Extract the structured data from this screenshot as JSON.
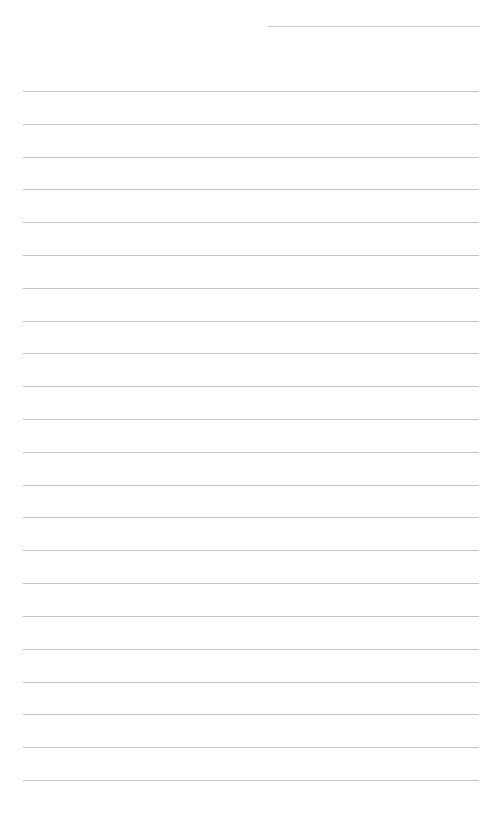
{
  "page": {
    "type": "lined-paper",
    "background": "#ffffff",
    "line_color": "#c4c4c4",
    "header_line": {
      "x": 268,
      "y": 26,
      "width": 212
    },
    "rules": {
      "count": 22,
      "x": 23,
      "width": 456,
      "y_positions": [
        91,
        124,
        157,
        189,
        222,
        255,
        288,
        321,
        353,
        386,
        419,
        452,
        485,
        517,
        550,
        583,
        616,
        649,
        682,
        714,
        747,
        780
      ]
    }
  }
}
